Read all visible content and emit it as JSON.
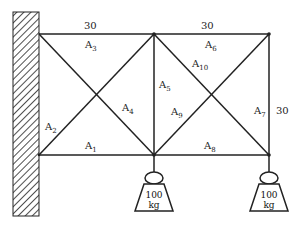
{
  "diagram": {
    "type": "truss",
    "dimensions": {
      "top_left_span": "30",
      "top_right_span": "30",
      "right_height": "30"
    },
    "members": [
      {
        "id": "A1",
        "base": "A",
        "sub": "1",
        "pos": "bottom chord left"
      },
      {
        "id": "A2",
        "base": "A",
        "sub": "2",
        "pos": "diagonal left lower"
      },
      {
        "id": "A3",
        "base": "A",
        "sub": "3",
        "pos": "top chord left"
      },
      {
        "id": "A4",
        "base": "A",
        "sub": "4",
        "pos": "diagonal left"
      },
      {
        "id": "A5",
        "base": "A",
        "sub": "5",
        "pos": "middle vertical"
      },
      {
        "id": "A6",
        "base": "A",
        "sub": "6",
        "pos": "top chord right"
      },
      {
        "id": "A7",
        "base": "A",
        "sub": "7",
        "pos": "right vertical"
      },
      {
        "id": "A8",
        "base": "A",
        "sub": "8",
        "pos": "bottom chord right"
      },
      {
        "id": "A9",
        "base": "A",
        "sub": "9",
        "pos": "diagonal right lower"
      },
      {
        "id": "A10",
        "base": "A",
        "sub": "10",
        "pos": "diagonal right upper"
      }
    ],
    "loads": [
      {
        "value": "100",
        "unit": "kg"
      },
      {
        "value": "100",
        "unit": "kg"
      }
    ]
  }
}
